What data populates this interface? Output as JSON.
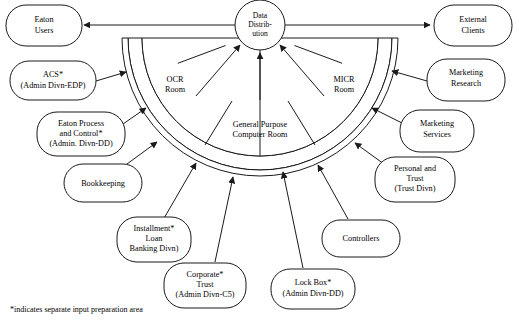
{
  "diagram": {
    "footnote": "*indicates separate input preparation area",
    "hub": {
      "name": "data-distribution",
      "lines": [
        "Data",
        "Distrib-",
        "ution"
      ]
    },
    "rooms": [
      {
        "name": "ocr-room",
        "lines": [
          "OCR",
          "Room"
        ]
      },
      {
        "name": "micr-room",
        "lines": [
          "MICR",
          "Room"
        ]
      },
      {
        "name": "general-purpose-computer-room",
        "lines": [
          "General Purpose",
          "Computer Room"
        ]
      }
    ],
    "outputs": [
      {
        "name": "eaton-users",
        "lines": [
          "Eaton",
          "Users"
        ]
      },
      {
        "name": "external-clients",
        "lines": [
          "External",
          "Clients"
        ]
      }
    ],
    "inputs": [
      {
        "name": "acs",
        "lines": [
          "ACS*",
          "(Admin Divn-EDP)"
        ]
      },
      {
        "name": "eaton-process-and-control",
        "lines": [
          "Eaton Process",
          "and Control*",
          "(Admin. Divn-DD)"
        ]
      },
      {
        "name": "bookkeeping",
        "lines": [
          "Bookkeeping"
        ]
      },
      {
        "name": "installment-loan",
        "lines": [
          "Installment*",
          "Loan",
          "Banking Divn)"
        ]
      },
      {
        "name": "corporate-trust",
        "lines": [
          "Corporate*",
          "Trust",
          "(Admin Divn-C5)"
        ]
      },
      {
        "name": "lock-box",
        "lines": [
          "Lock Box*",
          "(Admin Divn-DD)"
        ]
      },
      {
        "name": "controllers",
        "lines": [
          "Controllers"
        ]
      },
      {
        "name": "personal-and-trust",
        "lines": [
          "Personal and",
          "Trust",
          "(Trust Divn)"
        ]
      },
      {
        "name": "marketing-services",
        "lines": [
          "Marketing",
          "Services"
        ]
      },
      {
        "name": "marketing-research",
        "lines": [
          "Marketing",
          "Research"
        ]
      }
    ],
    "colors": {
      "stroke": "#1a1a1a",
      "fill": "#ffffff",
      "text": "#000000"
    }
  }
}
